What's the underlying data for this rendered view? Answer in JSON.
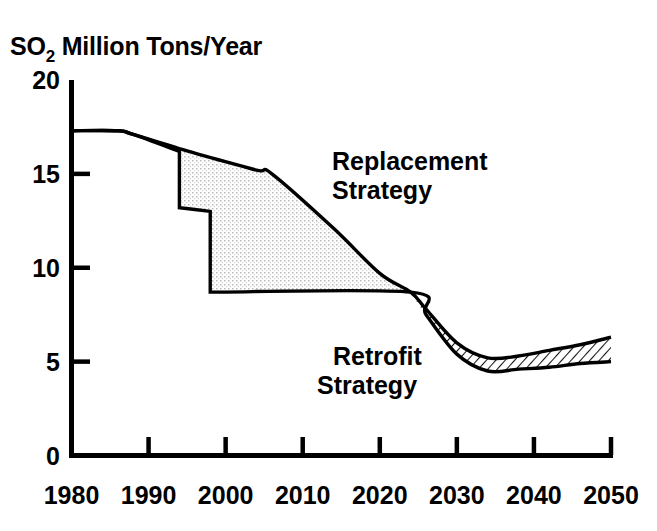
{
  "chart_data": {
    "type": "area",
    "title": "SO2 Million Tons/Year",
    "title_main": "SO",
    "title_sub": "2",
    "title_rest": " Million Tons/Year",
    "xlabel": "",
    "ylabel": "SO2 Million Tons/Year",
    "xlim": [
      1980,
      2050
    ],
    "ylim": [
      0,
      20
    ],
    "grid": false,
    "legend_position": "inline-annotations",
    "yticks": [
      "20",
      "15",
      "10",
      "5",
      "0"
    ],
    "ytick_values": [
      20,
      15,
      10,
      5,
      0
    ],
    "xticks": [
      "1980",
      "1990",
      "2000",
      "2010",
      "2020",
      "2030",
      "2040",
      "2050"
    ],
    "xtick_values": [
      1980,
      1990,
      2000,
      2010,
      2020,
      2030,
      2040,
      2050
    ],
    "annotations": [
      {
        "id": "replacement",
        "text_line1": "Replacement",
        "text_line2": "Strategy",
        "x": 2021,
        "y": 15.2
      },
      {
        "id": "retrofit",
        "text_line1": "Retrofit",
        "text_line2": "Strategy",
        "x": 2024,
        "y": 6.1
      }
    ],
    "series": [
      {
        "name": "Replacement Strategy",
        "style": "stipple-fill",
        "fill_color": "#efefef",
        "line_color": "#000000",
        "x": [
          1980,
          1986,
          1988,
          1996,
          2004,
          2006,
          2014,
          2020,
          2024,
          2026,
          2030,
          2034,
          2038,
          2042,
          2046,
          2050
        ],
        "values": [
          17.3,
          17.3,
          17.1,
          16.1,
          15.2,
          15.0,
          12.1,
          9.7,
          8.7,
          7.8,
          6.0,
          5.2,
          5.3,
          5.6,
          5.9,
          6.3
        ]
      },
      {
        "name": "Retrofit Strategy",
        "style": "hatch-fill",
        "fill_color": "#ffffff",
        "line_color": "#000000",
        "x": [
          1980,
          1986,
          1988,
          1994,
          1994,
          1998,
          1998,
          2024,
          2026,
          2030,
          2034,
          2038,
          2042,
          2046,
          2050
        ],
        "values": [
          17.3,
          17.3,
          17.1,
          16.2,
          13.2,
          13.0,
          8.7,
          8.7,
          7.5,
          5.4,
          4.5,
          4.6,
          4.7,
          4.9,
          5.0
        ]
      }
    ]
  },
  "colors": {
    "line": "#000000",
    "replacement_fill": "#efefef",
    "retrofit_fill": "#ffffff",
    "background": "#ffffff"
  }
}
